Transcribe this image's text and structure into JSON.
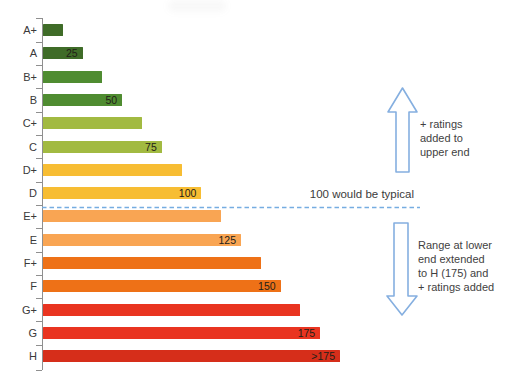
{
  "chart_data": {
    "type": "bar",
    "orientation": "horizontal",
    "title": "",
    "xlabel": "",
    "ylabel": "",
    "xlim": [
      0,
      190
    ],
    "grid": false,
    "categories": [
      "A+",
      "A",
      "B+",
      "B",
      "C+",
      "C",
      "D+",
      "D",
      "E+",
      "E",
      "F+",
      "F",
      "G+",
      "G",
      "H"
    ],
    "values": [
      12.5,
      25,
      37.5,
      50,
      62.5,
      75,
      87.5,
      100,
      112.5,
      125,
      137.5,
      150,
      162.5,
      175,
      187.5
    ],
    "bar_labels": [
      "",
      "25",
      "",
      "50",
      "",
      "75",
      "",
      "100",
      "",
      "125",
      "",
      "150",
      "",
      "175",
      ">175"
    ],
    "bar_colors": [
      "#3f6c28",
      "#3f6c28",
      "#4f8c31",
      "#4f8c31",
      "#a2ba41",
      "#a2ba41",
      "#f7bd33",
      "#f7bd33",
      "#f9a553",
      "#f9a553",
      "#ee7117",
      "#ee7117",
      "#e93420",
      "#e93420",
      "#d62e1a"
    ],
    "reference_line": {
      "value": 100,
      "label": "100 would be typical",
      "style": "dashed",
      "color": "#76ade1"
    },
    "annotations": [
      {
        "id": "upper",
        "arrow": "up",
        "text": "+ ratings\nadded to\nupper end"
      },
      {
        "id": "lower",
        "arrow": "down",
        "text": "Range at lower\nend extended\nto H (175) and\n+ ratings added"
      }
    ]
  },
  "colors": {
    "arrow_outline": "#85afe0",
    "axis": "#8f8f8f",
    "label_text": "#3a3a3a"
  }
}
